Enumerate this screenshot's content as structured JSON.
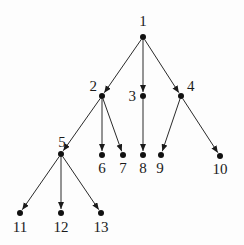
{
  "diagram": {
    "type": "directed-tree",
    "root": "1",
    "colors": {
      "edge": "#2a2a2a",
      "node": "#111111",
      "label": "#1a1a1a",
      "background": "#fdfdfd"
    },
    "nodes": [
      {
        "id": "1",
        "label": "1",
        "x": 143,
        "y": 37,
        "lx": 143,
        "ly": 26,
        "anchor": "middle"
      },
      {
        "id": "2",
        "label": "2",
        "x": 102,
        "y": 96,
        "lx": 97,
        "ly": 91,
        "anchor": "end"
      },
      {
        "id": "3",
        "label": "3",
        "x": 143,
        "y": 96,
        "lx": 136,
        "ly": 101,
        "anchor": "end"
      },
      {
        "id": "4",
        "label": "4",
        "x": 181,
        "y": 96,
        "lx": 187,
        "ly": 91,
        "anchor": "start"
      },
      {
        "id": "5",
        "label": "5",
        "x": 61,
        "y": 154,
        "lx": 62,
        "ly": 147,
        "anchor": "middle"
      },
      {
        "id": "6",
        "label": "6",
        "x": 102,
        "y": 155,
        "lx": 102,
        "ly": 173,
        "anchor": "middle"
      },
      {
        "id": "7",
        "label": "7",
        "x": 123,
        "y": 155,
        "lx": 123,
        "ly": 173,
        "anchor": "middle"
      },
      {
        "id": "8",
        "label": "8",
        "x": 143,
        "y": 155,
        "lx": 143,
        "ly": 173,
        "anchor": "middle"
      },
      {
        "id": "9",
        "label": "9",
        "x": 161,
        "y": 155,
        "lx": 160,
        "ly": 173,
        "anchor": "middle"
      },
      {
        "id": "10",
        "label": "10",
        "x": 220,
        "y": 156,
        "lx": 220,
        "ly": 174,
        "anchor": "middle"
      },
      {
        "id": "11",
        "label": "11",
        "x": 20,
        "y": 213,
        "lx": 20,
        "ly": 232,
        "anchor": "middle"
      },
      {
        "id": "12",
        "label": "12",
        "x": 61,
        "y": 213,
        "lx": 61,
        "ly": 232,
        "anchor": "middle"
      },
      {
        "id": "13",
        "label": "13",
        "x": 101,
        "y": 213,
        "lx": 101,
        "ly": 232,
        "anchor": "middle"
      }
    ],
    "edges": [
      {
        "from": "1",
        "to": "2"
      },
      {
        "from": "1",
        "to": "3"
      },
      {
        "from": "1",
        "to": "4"
      },
      {
        "from": "2",
        "to": "5"
      },
      {
        "from": "2",
        "to": "6"
      },
      {
        "from": "2",
        "to": "7"
      },
      {
        "from": "3",
        "to": "8"
      },
      {
        "from": "4",
        "to": "9"
      },
      {
        "from": "4",
        "to": "10"
      },
      {
        "from": "5",
        "to": "11"
      },
      {
        "from": "5",
        "to": "12"
      },
      {
        "from": "5",
        "to": "13"
      }
    ]
  }
}
